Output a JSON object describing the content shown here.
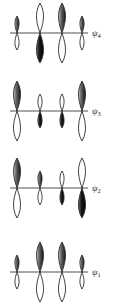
{
  "figure": {
    "background_color": "#ffffff",
    "axis_color": "#8a8a8a",
    "outline_color": "#2b2b2b",
    "shaded_fill_dark": "#141414",
    "shaded_fill_mid": "#6e6e6e",
    "shaded_fill_light": "#d8d8d8",
    "empty_fill": "#ffffff"
  },
  "orbitals": [
    {
      "id": "psi4",
      "label": "ψ",
      "subscript": "4",
      "nodes": 3,
      "axis_y": 33,
      "axis_x_start": 10,
      "axis_x_end": 88,
      "label_x": 92,
      "label_y": 29,
      "atoms": [
        {
          "index": 1,
          "cx": 17,
          "size": "small",
          "shaded_half": "top"
        },
        {
          "index": 2,
          "cx": 40,
          "size": "large",
          "shaded_half": "bottom"
        },
        {
          "index": 3,
          "cx": 62,
          "size": "large",
          "shaded_half": "top"
        },
        {
          "index": 4,
          "cx": 82,
          "size": "small",
          "shaded_half": "top"
        }
      ]
    },
    {
      "id": "psi3",
      "label": "ψ",
      "subscript": "3",
      "nodes": 2,
      "axis_y": 111,
      "axis_x_start": 10,
      "axis_x_end": 88,
      "label_x": 92,
      "label_y": 107,
      "atoms": [
        {
          "index": 1,
          "cx": 17,
          "size": "large",
          "shaded_half": "top"
        },
        {
          "index": 2,
          "cx": 40,
          "size": "small",
          "shaded_half": "bottom"
        },
        {
          "index": 3,
          "cx": 62,
          "size": "small",
          "shaded_half": "bottom"
        },
        {
          "index": 4,
          "cx": 82,
          "size": "large",
          "shaded_half": "top"
        }
      ]
    },
    {
      "id": "psi2",
      "label": "ψ",
      "subscript": "2",
      "nodes": 1,
      "axis_y": 188,
      "axis_x_start": 10,
      "axis_x_end": 88,
      "label_x": 92,
      "label_y": 184,
      "atoms": [
        {
          "index": 1,
          "cx": 17,
          "size": "large",
          "shaded_half": "top"
        },
        {
          "index": 2,
          "cx": 40,
          "size": "small",
          "shaded_half": "top"
        },
        {
          "index": 3,
          "cx": 62,
          "size": "small",
          "shaded_half": "bottom"
        },
        {
          "index": 4,
          "cx": 82,
          "size": "large",
          "shaded_half": "bottom"
        }
      ]
    },
    {
      "id": "psi1",
      "label": "ψ",
      "subscript": "1",
      "nodes": 0,
      "axis_y": 272,
      "axis_x_start": 10,
      "axis_x_end": 88,
      "label_x": 92,
      "label_y": 268,
      "atoms": [
        {
          "index": 1,
          "cx": 17,
          "size": "small",
          "shaded_half": "top"
        },
        {
          "index": 2,
          "cx": 40,
          "size": "large",
          "shaded_half": "top"
        },
        {
          "index": 3,
          "cx": 62,
          "size": "large",
          "shaded_half": "top"
        },
        {
          "index": 4,
          "cx": 82,
          "size": "small",
          "shaded_half": "top"
        }
      ]
    }
  ]
}
